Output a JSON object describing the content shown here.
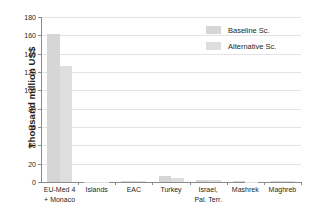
{
  "chart_data": {
    "type": "bar",
    "title": "",
    "xlabel": "",
    "ylabel": "Thousand million US$",
    "ylim": [
      0,
      180
    ],
    "yticks": [
      0,
      20,
      40,
      60,
      80,
      100,
      120,
      140,
      160,
      180
    ],
    "ytick_labels": [
      "0",
      "20",
      "40",
      "60",
      "80",
      "100",
      "120",
      "140",
      "160",
      "180"
    ],
    "grid": "horizontal",
    "legend_position": "top-right",
    "categories": [
      "EU-Med 4 + Monaco",
      "Islands",
      "EAC",
      "Turkey",
      "Israel, Pal. Terr.",
      "Mashrek",
      "Maghreb"
    ],
    "category_lines": [
      [
        "EU-Med 4",
        "+ Monaco"
      ],
      [
        "Islands",
        ""
      ],
      [
        "EAC",
        ""
      ],
      [
        "Turkey",
        ""
      ],
      [
        "Israel,",
        "Pal. Terr."
      ],
      [
        "Mashrek",
        ""
      ],
      [
        "Maghreb",
        ""
      ]
    ],
    "series": [
      {
        "name": "Baseline Sc.",
        "color": "#d6d6d6",
        "values": [
          162,
          0.4,
          1.6,
          6.2,
          2.6,
          0.7,
          1.6
        ]
      },
      {
        "name": "Alternative Sc.",
        "color": "#dedede",
        "values": [
          127,
          0.3,
          1.2,
          4.8,
          2.0,
          0.5,
          1.2
        ]
      }
    ]
  },
  "legend": {
    "items": [
      {
        "label": "Baseline Sc.",
        "color": "#d6d6d6"
      },
      {
        "label": "Alternative Sc.",
        "color": "#dedede"
      }
    ]
  },
  "axis": {
    "y_title": "Thousand million US$"
  }
}
